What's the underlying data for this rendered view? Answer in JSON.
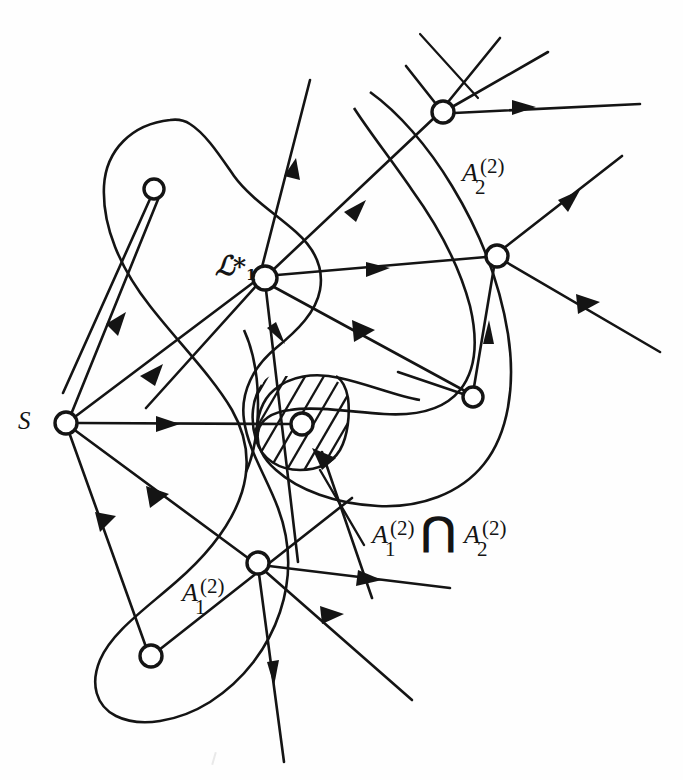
{
  "figure": {
    "background_color": "#fefefe",
    "ink_color": "#141414"
  },
  "labels": {
    "source": "S",
    "script_L": "ℒ",
    "script_L_star": "*",
    "script_L_sub": "1",
    "set_A_base": "A",
    "set_superscript": "(2)",
    "set_a1_sub": "1",
    "set_a2_sub": "2",
    "intersection_symbol": "⋂"
  },
  "regions": [
    {
      "name": "A_1^(2)",
      "base": "A",
      "superscript": "(2)",
      "subscript": "1",
      "label_x": 182,
      "label_y": 585,
      "description": "large left lobe closed curve"
    },
    {
      "name": "A_2^(2)",
      "base": "A",
      "superscript": "(2)",
      "subscript": "2",
      "label_x": 462,
      "label_y": 165,
      "description": "large right crescent closed curve"
    },
    {
      "name": "A_1^(2) cap A_2^(2)",
      "base": "A",
      "superscript": "(2)",
      "subscript_left": "1",
      "subscript_right": "2",
      "label_x": 372,
      "label_y": 518,
      "description": "hatched lens-shaped intersection region"
    }
  ],
  "nodes": [
    {
      "id": "s",
      "label": "S",
      "x": 66,
      "y": 423,
      "r": 11
    },
    {
      "id": "n_tl",
      "label": "",
      "x": 154,
      "y": 189,
      "r": 10
    },
    {
      "id": "n_l1",
      "label": "ℒ*1",
      "x": 265,
      "y": 278,
      "r": 12
    },
    {
      "id": "n_top",
      "label": "",
      "x": 443,
      "y": 112,
      "r": 11
    },
    {
      "id": "n_right",
      "label": "",
      "x": 497,
      "y": 256,
      "r": 11
    },
    {
      "id": "n_inner",
      "label": "",
      "x": 473,
      "y": 397,
      "r": 10
    },
    {
      "id": "n_hatch",
      "label": "",
      "x": 302,
      "y": 424,
      "r": 11
    },
    {
      "id": "n_bot",
      "label": "",
      "x": 258,
      "y": 563,
      "r": 11
    },
    {
      "id": "n_bl",
      "label": "",
      "x": 151,
      "y": 656,
      "r": 11
    }
  ]
}
